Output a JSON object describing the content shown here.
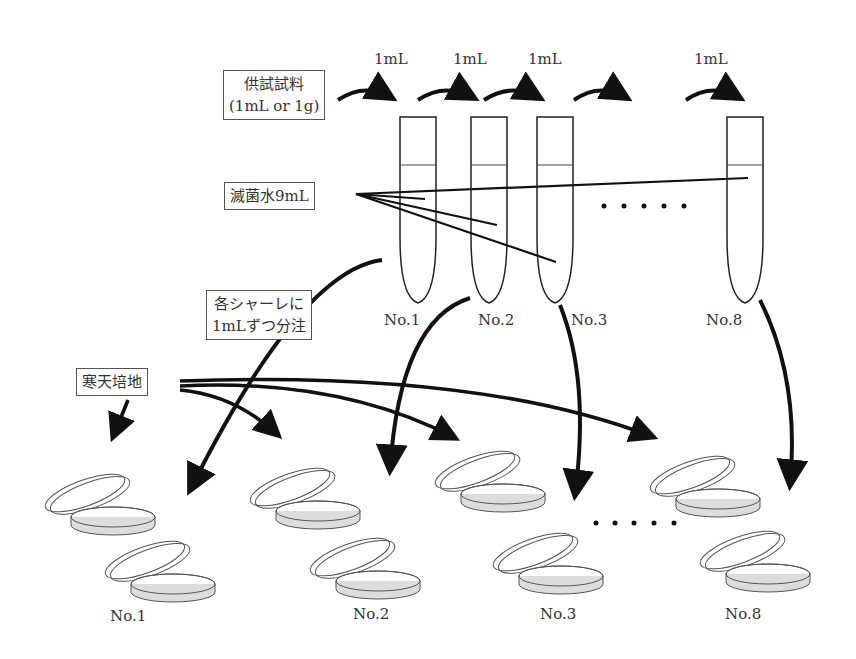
{
  "sample_box": {
    "line1": "供試試料",
    "line2": "(1mL or 1g)"
  },
  "transfer_labels": [
    "1mL",
    "1mL",
    "1mL",
    "1mL"
  ],
  "water_box": "滅菌水9mL",
  "dispense_box": {
    "line1": "各シャーレに",
    "line2": "1mLずつ分注"
  },
  "agar_box": "寒天培地",
  "tubes": [
    {
      "label": "No.1"
    },
    {
      "label": "No.2"
    },
    {
      "label": "No.3"
    },
    {
      "label": "No.8"
    }
  ],
  "plates": [
    {
      "label": "No.1"
    },
    {
      "label": "No.2"
    },
    {
      "label": "No.3"
    },
    {
      "label": "No.8"
    }
  ],
  "ellipsis": "・・・・・",
  "colors": {
    "line": "#111111",
    "outline": "#444444",
    "agar_fill": "#dcdcdc"
  }
}
